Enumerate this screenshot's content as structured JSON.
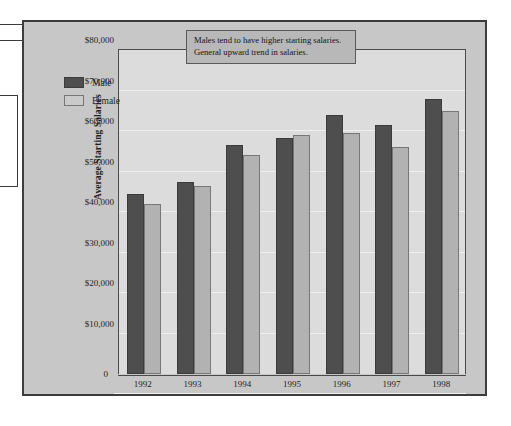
{
  "chart_data": {
    "type": "bar",
    "title": "",
    "xlabel": "",
    "ylabel": "Average Starting Salaries",
    "categories": [
      "1992",
      "1993",
      "1994",
      "1995",
      "1996",
      "1997",
      "1998"
    ],
    "series": [
      {
        "name": "Male",
        "color": "#4e4e4e",
        "values": [
          44500,
          47500,
          56500,
          58200,
          64000,
          61500,
          68000
        ]
      },
      {
        "name": "Female",
        "color": "#b2b2b2",
        "values": [
          42000,
          46500,
          54000,
          59000,
          59500,
          56000,
          65000
        ]
      }
    ],
    "ylim": [
      0,
      80000
    ],
    "ytick_values": [
      0,
      10000,
      20000,
      30000,
      40000,
      50000,
      60000,
      70000,
      80000
    ],
    "ytick_labels": [
      "0",
      "$10,000",
      "$20,000",
      "$30,000",
      "$40,000",
      "$50,000",
      "$60,000",
      "$70,000",
      "$80,000"
    ],
    "grid": true,
    "legend_position": "upper-left",
    "annotations": [
      "Males tend to have higher starting salaries.",
      "General upward trend in salaries."
    ]
  },
  "legend": {
    "items": [
      {
        "label": "Male"
      },
      {
        "label": "Female"
      }
    ]
  },
  "annotation": {
    "line1": "Males tend to have higher starting salaries.",
    "line2": "General upward trend in salaries."
  },
  "axis": {
    "y_title": "Average Starting Salaries",
    "zero_label": "0"
  },
  "colors": {
    "male_bar": "#4e4e4e",
    "female_bar": "#b2b2b2",
    "frame_background": "#c7c7c7",
    "plot_background": "#dcdcdc",
    "annotation_background": "#b8b8b8"
  }
}
